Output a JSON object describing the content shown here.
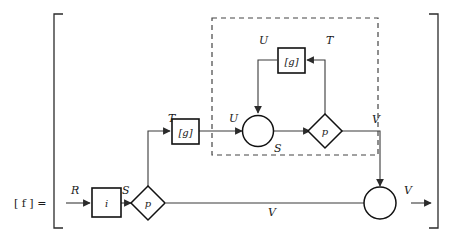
{
  "figure": {
    "lhs_label": "[ f ] =",
    "kind": "dataflow-block-diagram"
  },
  "nodes": {
    "i_box": {
      "label": "i",
      "shape": "square"
    },
    "g_box_outer": {
      "label": "[g]",
      "shape": "square"
    },
    "g_box_inner": {
      "label": "[g]",
      "shape": "square"
    },
    "p_diamond_left": {
      "label": "p",
      "shape": "diamond"
    },
    "p_diamond_inner": {
      "label": "p",
      "shape": "diamond"
    },
    "merge_circle_inner": {
      "label": "",
      "shape": "circle"
    },
    "merge_circle_output": {
      "label": "",
      "shape": "circle"
    }
  },
  "edge_labels": {
    "input_R": "R",
    "after_i_S": "S",
    "to_g_outer_T": "T",
    "g_outer_out_U": "U",
    "inner_top_U": "U",
    "inner_top_T": "T",
    "inner_mid_S": "S",
    "inner_out_V": "V",
    "bypass_V": "V",
    "output_V": "V"
  },
  "colors": {
    "ink": "#1a1a1a",
    "wire": "#3a3a3a",
    "node_stroke": "#111111",
    "dashed_stroke": "#444444",
    "background": "#ffffff"
  }
}
